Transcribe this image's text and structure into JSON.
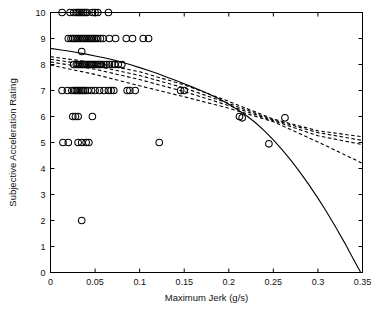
{
  "chart_data": {
    "type": "scatter",
    "title": "",
    "xlabel": "Maximum Jerk (g/s)",
    "ylabel": "Subjective Acceleration Rating",
    "xlim": [
      0,
      0.35
    ],
    "ylim": [
      0,
      10
    ],
    "grid": false,
    "legend": "none",
    "xticks": [
      0,
      0.05,
      0.1,
      0.15,
      0.2,
      0.25,
      0.3,
      0.35
    ],
    "xticklabels": [
      "0",
      "0.05",
      "0.1",
      "0.15",
      "0.2",
      "0.25",
      "0.3",
      "0.35"
    ],
    "yticks": [
      0,
      1,
      2,
      3,
      4,
      5,
      6,
      7,
      8,
      9,
      10
    ],
    "yticklabels": [
      "0",
      "1",
      "2",
      "3",
      "4",
      "5",
      "6",
      "7",
      "8",
      "9",
      "10"
    ],
    "marker": "open-circle",
    "marker_color": "#000000",
    "points": [
      [
        0.013,
        10
      ],
      [
        0.022,
        10
      ],
      [
        0.026,
        10
      ],
      [
        0.029,
        10
      ],
      [
        0.031,
        10
      ],
      [
        0.033,
        10
      ],
      [
        0.035,
        10
      ],
      [
        0.037,
        10
      ],
      [
        0.039,
        10
      ],
      [
        0.041,
        10
      ],
      [
        0.047,
        10
      ],
      [
        0.05,
        10
      ],
      [
        0.053,
        10
      ],
      [
        0.065,
        10
      ],
      [
        0.02,
        9
      ],
      [
        0.023,
        9
      ],
      [
        0.025,
        9
      ],
      [
        0.027,
        9
      ],
      [
        0.029,
        9
      ],
      [
        0.031,
        9
      ],
      [
        0.033,
        9
      ],
      [
        0.035,
        9
      ],
      [
        0.037,
        9
      ],
      [
        0.039,
        9
      ],
      [
        0.041,
        9
      ],
      [
        0.043,
        9
      ],
      [
        0.045,
        9
      ],
      [
        0.047,
        9
      ],
      [
        0.049,
        9
      ],
      [
        0.051,
        9
      ],
      [
        0.053,
        9
      ],
      [
        0.056,
        9
      ],
      [
        0.059,
        9
      ],
      [
        0.066,
        9
      ],
      [
        0.073,
        9
      ],
      [
        0.085,
        9
      ],
      [
        0.092,
        9
      ],
      [
        0.104,
        9
      ],
      [
        0.11,
        9
      ],
      [
        0.035,
        8.5
      ],
      [
        0.026,
        8
      ],
      [
        0.029,
        8
      ],
      [
        0.031,
        8
      ],
      [
        0.033,
        8
      ],
      [
        0.035,
        8
      ],
      [
        0.037,
        8
      ],
      [
        0.039,
        8
      ],
      [
        0.041,
        8
      ],
      [
        0.043,
        8
      ],
      [
        0.045,
        8
      ],
      [
        0.047,
        8
      ],
      [
        0.049,
        8
      ],
      [
        0.051,
        8
      ],
      [
        0.053,
        8
      ],
      [
        0.055,
        8
      ],
      [
        0.057,
        8
      ],
      [
        0.06,
        8
      ],
      [
        0.063,
        8
      ],
      [
        0.066,
        8
      ],
      [
        0.069,
        8
      ],
      [
        0.072,
        8
      ],
      [
        0.076,
        8
      ],
      [
        0.08,
        8
      ],
      [
        0.013,
        7
      ],
      [
        0.019,
        7
      ],
      [
        0.024,
        7
      ],
      [
        0.027,
        7
      ],
      [
        0.029,
        7
      ],
      [
        0.031,
        7
      ],
      [
        0.033,
        7
      ],
      [
        0.035,
        7
      ],
      [
        0.037,
        7
      ],
      [
        0.039,
        7
      ],
      [
        0.042,
        7
      ],
      [
        0.046,
        7
      ],
      [
        0.05,
        7
      ],
      [
        0.055,
        7
      ],
      [
        0.06,
        7
      ],
      [
        0.065,
        7
      ],
      [
        0.068,
        7
      ],
      [
        0.071,
        7
      ],
      [
        0.086,
        7
      ],
      [
        0.089,
        7
      ],
      [
        0.095,
        7
      ],
      [
        0.146,
        7
      ],
      [
        0.15,
        7
      ],
      [
        0.025,
        6
      ],
      [
        0.028,
        6
      ],
      [
        0.031,
        6
      ],
      [
        0.047,
        6
      ],
      [
        0.212,
        6
      ],
      [
        0.215,
        5.95
      ],
      [
        0.263,
        5.95
      ],
      [
        0.014,
        5
      ],
      [
        0.02,
        5
      ],
      [
        0.031,
        5
      ],
      [
        0.035,
        5
      ],
      [
        0.04,
        5
      ],
      [
        0.043,
        5
      ],
      [
        0.122,
        5
      ],
      [
        0.245,
        4.95
      ],
      [
        0.035,
        2
      ]
    ],
    "curves": [
      {
        "name": "model-fit-solid",
        "style": "solid",
        "color": "#000000",
        "points": [
          [
            0.0,
            8.62
          ],
          [
            0.01,
            8.57
          ],
          [
            0.02,
            8.52
          ],
          [
            0.03,
            8.46
          ],
          [
            0.04,
            8.4
          ],
          [
            0.05,
            8.33
          ],
          [
            0.06,
            8.26
          ],
          [
            0.07,
            8.18
          ],
          [
            0.08,
            8.09
          ],
          [
            0.09,
            7.99
          ],
          [
            0.1,
            7.88
          ],
          [
            0.11,
            7.77
          ],
          [
            0.12,
            7.65
          ],
          [
            0.13,
            7.52
          ],
          [
            0.14,
            7.39
          ],
          [
            0.15,
            7.26
          ],
          [
            0.16,
            7.12
          ],
          [
            0.17,
            6.98
          ],
          [
            0.18,
            6.83
          ],
          [
            0.19,
            6.66
          ],
          [
            0.2,
            6.47
          ],
          [
            0.21,
            6.26
          ],
          [
            0.22,
            6.03
          ],
          [
            0.23,
            5.76
          ],
          [
            0.24,
            5.45
          ],
          [
            0.25,
            5.1
          ],
          [
            0.26,
            4.72
          ],
          [
            0.27,
            4.3
          ],
          [
            0.28,
            3.85
          ],
          [
            0.29,
            3.37
          ],
          [
            0.3,
            2.86
          ],
          [
            0.31,
            2.32
          ],
          [
            0.32,
            1.74
          ],
          [
            0.33,
            1.14
          ],
          [
            0.34,
            0.5
          ],
          [
            0.348,
            0.0
          ]
        ]
      },
      {
        "name": "regression-dashed-1",
        "style": "dashed",
        "color": "#000000",
        "points": [
          [
            0.0,
            8.3
          ],
          [
            0.05,
            8.07
          ],
          [
            0.1,
            7.72
          ],
          [
            0.15,
            7.22
          ],
          [
            0.2,
            6.58
          ],
          [
            0.25,
            5.9
          ],
          [
            0.3,
            5.45
          ],
          [
            0.35,
            5.22
          ]
        ]
      },
      {
        "name": "regression-dashed-2",
        "style": "dashed",
        "color": "#000000",
        "points": [
          [
            0.0,
            8.2
          ],
          [
            0.05,
            7.95
          ],
          [
            0.1,
            7.58
          ],
          [
            0.15,
            7.1
          ],
          [
            0.2,
            6.5
          ],
          [
            0.25,
            5.87
          ],
          [
            0.3,
            5.38
          ],
          [
            0.35,
            5.08
          ]
        ]
      },
      {
        "name": "regression-dashed-3",
        "style": "dashed",
        "color": "#000000",
        "points": [
          [
            0.0,
            8.1
          ],
          [
            0.05,
            7.82
          ],
          [
            0.1,
            7.42
          ],
          [
            0.15,
            6.96
          ],
          [
            0.2,
            6.42
          ],
          [
            0.25,
            5.84
          ],
          [
            0.3,
            5.26
          ],
          [
            0.35,
            4.92
          ]
        ]
      },
      {
        "name": "regression-dashed-4",
        "style": "dashed",
        "color": "#000000",
        "points": [
          [
            0.0,
            7.98
          ],
          [
            0.05,
            7.62
          ],
          [
            0.1,
            7.18
          ],
          [
            0.15,
            6.76
          ],
          [
            0.2,
            6.32
          ],
          [
            0.25,
            5.8
          ],
          [
            0.3,
            5.02
          ],
          [
            0.35,
            4.2
          ]
        ]
      }
    ]
  }
}
